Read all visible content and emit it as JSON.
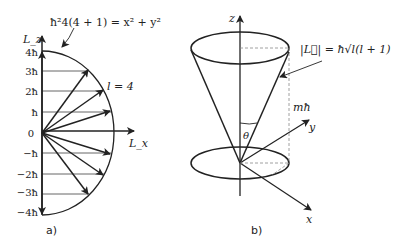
{
  "figure_a": {
    "caption": "a)",
    "equation": "ħ²4(4 + 1) = x² + y²",
    "l_label": "l = 4",
    "axis_y_label": "L_z",
    "axis_x_label": "L_x",
    "ticks": [
      "4ħ",
      "3ħ",
      "2ħ",
      "ħ",
      "0",
      "−ħ",
      "−2ħ",
      "−3ħ",
      "−4ħ"
    ],
    "m_values": [
      4,
      3,
      2,
      1,
      0,
      -1,
      -2,
      -3,
      -4
    ]
  },
  "figure_b": {
    "caption": "b)",
    "magnitude_label": "|L⃗| = ħ√l(l + 1)",
    "projection_label": "mħ",
    "angle_label": "θ",
    "axis_z": "z",
    "axis_y": "y",
    "axis_x": "x"
  },
  "colors": {
    "ink": "#222222",
    "dashed": "#888888"
  }
}
